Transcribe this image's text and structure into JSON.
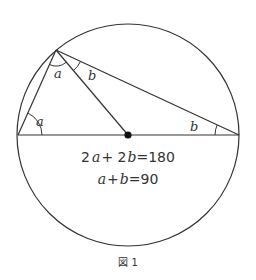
{
  "figure": {
    "caption": "図 1",
    "circle": {
      "cx": 128,
      "cy": 135,
      "r": 111,
      "color": "#333333"
    },
    "points": {
      "left": {
        "x": 18,
        "y": 135
      },
      "right": {
        "x": 239,
        "y": 135
      },
      "top": {
        "x": 56,
        "y": 50
      },
      "center": {
        "x": 128,
        "y": 135
      }
    },
    "angle_labels": [
      {
        "id": "a_left",
        "text": "a",
        "x": 36,
        "y": 126
      },
      {
        "id": "a_top",
        "text": "a",
        "x": 54,
        "y": 78
      },
      {
        "id": "b_top",
        "text": "b",
        "x": 88,
        "y": 80
      },
      {
        "id": "b_right",
        "text": "b",
        "x": 190,
        "y": 131
      }
    ],
    "equations": [
      {
        "parts": [
          "2",
          "a",
          "+ 2",
          "b",
          "=180"
        ],
        "text": "2a+2b=180"
      },
      {
        "parts": [
          "a",
          "+",
          "b",
          "=90"
        ],
        "text": "a+b=90"
      }
    ]
  }
}
